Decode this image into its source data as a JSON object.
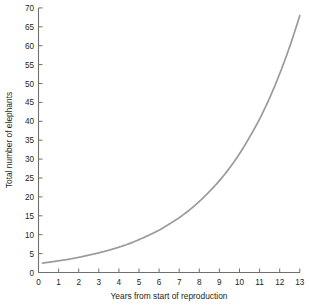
{
  "chart_data": {
    "type": "line",
    "title": "",
    "xlabel": "Years from start of reproduction",
    "ylabel": "Total number of elephants",
    "xlim": [
      0,
      13
    ],
    "ylim": [
      0,
      70
    ],
    "xticks": [
      0,
      1,
      2,
      3,
      4,
      5,
      6,
      7,
      8,
      9,
      10,
      11,
      12,
      13
    ],
    "xtick_labels": [
      "0",
      "1",
      "2",
      "3",
      "4",
      "5",
      "6",
      "7",
      "8",
      "9",
      "10",
      "11",
      "12",
      "13"
    ],
    "yticks": [
      0,
      5,
      10,
      15,
      20,
      25,
      30,
      35,
      40,
      45,
      50,
      55,
      60,
      65,
      70
    ],
    "ytick_labels": [
      "0",
      "5",
      "10",
      "15",
      "20",
      "25",
      "30",
      "35",
      "40",
      "45",
      "50",
      "55",
      "60",
      "65",
      "70"
    ],
    "grid": false,
    "legend": false,
    "legend_position": "none",
    "series": [
      {
        "name": "Total number of elephants",
        "color": "#9a9a9a",
        "x": [
          0.2,
          0.5,
          1.0,
          1.5,
          2.0,
          2.5,
          3.0,
          3.5,
          4.0,
          4.5,
          5.0,
          5.5,
          6.0,
          6.5,
          7.0,
          7.5,
          8.0,
          8.5,
          9.0,
          9.5,
          10.0,
          10.5,
          11.0,
          11.5,
          12.0,
          12.5,
          13.0,
          13.15
        ],
        "y": [
          2.5,
          2.7,
          3.1,
          3.5,
          4.0,
          4.6,
          5.2,
          5.9,
          6.7,
          7.6,
          8.7,
          9.9,
          11.2,
          12.8,
          14.5,
          16.5,
          18.8,
          21.4,
          24.3,
          27.6,
          31.4,
          35.8,
          40.6,
          46.2,
          52.6,
          59.8,
          68.0,
          66.7
        ]
      }
    ],
    "annotations": []
  },
  "figure": {
    "background_color": "#ffffff",
    "axis_color": "#6f6f6f",
    "text_color": "#231f20",
    "curve_color": "#9a9a9a"
  }
}
